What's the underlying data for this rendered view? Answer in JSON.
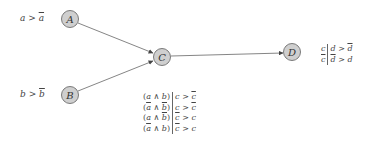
{
  "diagram": {
    "type": "bayesian-network",
    "nodes": [
      {
        "id": "A",
        "label": "A"
      },
      {
        "id": "B",
        "label": "B"
      },
      {
        "id": "C",
        "label": "C"
      },
      {
        "id": "D",
        "label": "D"
      }
    ],
    "edges": [
      {
        "from": "A",
        "to": "C"
      },
      {
        "from": "B",
        "to": "C"
      },
      {
        "from": "C",
        "to": "D"
      }
    ],
    "node_labels": {
      "A": {
        "var": "a",
        "op": ">",
        "neg": "a"
      },
      "B": {
        "var": "b",
        "op": ">",
        "neg": "b"
      }
    },
    "cpt_C": {
      "rows": [
        {
          "a": "a",
          "a_bar": false,
          "b": "b",
          "b_bar": false,
          "lhs_c": "c",
          "lhs_c_bar": false,
          "rhs_c": "c",
          "rhs_c_bar": true
        },
        {
          "a": "a",
          "a_bar": true,
          "b": "b",
          "b_bar": true,
          "lhs_c": "c",
          "lhs_c_bar": false,
          "rhs_c": "c",
          "rhs_c_bar": true
        },
        {
          "a": "a",
          "a_bar": false,
          "b": "b",
          "b_bar": true,
          "lhs_c": "c",
          "lhs_c_bar": true,
          "rhs_c": "c",
          "rhs_c_bar": false
        },
        {
          "a": "a",
          "a_bar": true,
          "b": "b",
          "b_bar": false,
          "lhs_c": "c",
          "lhs_c_bar": true,
          "rhs_c": "c",
          "rhs_c_bar": false
        }
      ],
      "and_symbol": "∧",
      "op": ">"
    },
    "cpt_D": {
      "rows": [
        {
          "cond": "c",
          "cond_bar": false,
          "lhs": "d",
          "lhs_bar": false,
          "rhs": "d",
          "rhs_bar": true
        },
        {
          "cond": "c",
          "cond_bar": true,
          "lhs": "d",
          "lhs_bar": true,
          "rhs": "d",
          "rhs_bar": false
        }
      ],
      "op": ">"
    },
    "colors": {
      "node_fill": "#cfcfcf",
      "node_stroke": "#7a7a7a",
      "edge": "#555555",
      "text": "#444444"
    }
  }
}
